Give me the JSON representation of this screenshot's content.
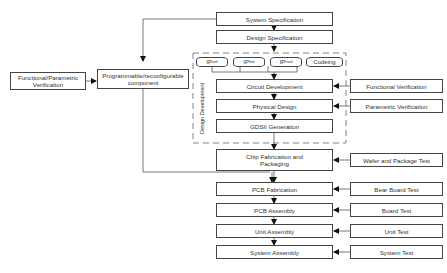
{
  "diagram": {
    "main_flow": [
      {
        "id": "system_spec",
        "label": "System Specification"
      },
      {
        "id": "design_spec",
        "label": "Design Specification"
      },
      {
        "id": "circuit_dev",
        "label": "Circuit Development"
      },
      {
        "id": "physical_design",
        "label": "Physical Design"
      },
      {
        "id": "gdsii",
        "label": "GDSII Generation"
      },
      {
        "id": "chip_fab",
        "label": "Chip Fabrication and Packaging"
      },
      {
        "id": "pcb_fab",
        "label": "PCB Fabrication"
      },
      {
        "id": "pcb_assembly",
        "label": "PCB Assembly"
      },
      {
        "id": "unit_assembly",
        "label": "Unit Assembly"
      },
      {
        "id": "system_assembly",
        "label": "System Assembly"
      }
    ],
    "ip_blocks": [
      {
        "label": "IP",
        "sub": "soft"
      },
      {
        "label": "IP",
        "sub": "firm"
      },
      {
        "label": "IP",
        "sub": "hard"
      },
      {
        "label": "Codeing",
        "sub": ""
      }
    ],
    "design_group_label": "Design Development",
    "verification": [
      {
        "label": "Functional Verification",
        "target": "circuit_dev"
      },
      {
        "label": "Parametric Verification",
        "target": "physical_design"
      },
      {
        "label": "Wafer and Package Test",
        "target": "chip_fab"
      },
      {
        "label": "Bear Board Test",
        "target": "pcb_fab"
      },
      {
        "label": "Board Test",
        "target": "pcb_assembly"
      },
      {
        "label": "Unit Test",
        "target": "unit_assembly"
      },
      {
        "label": "System Test",
        "target": "system_assembly"
      }
    ],
    "left": {
      "func_param_verification": "Functional/Parametric Verification",
      "programmable": "Programmable/reconfigurable component"
    }
  }
}
